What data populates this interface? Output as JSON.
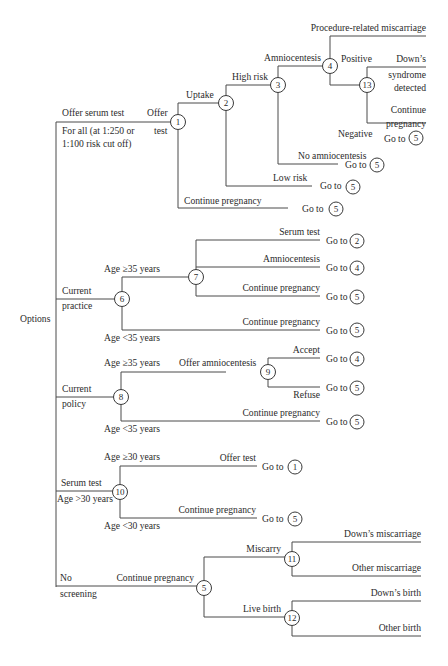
{
  "diagram": {
    "root_label": "Options",
    "options": {
      "offer_serum_test": {
        "label": "Offer serum test",
        "sublabel_1": "For all (at 1:250 or",
        "sublabel_2": "1:100 risk cut off)"
      },
      "current_practice": {
        "label_1": "Current",
        "label_2": "practice"
      },
      "current_policy": {
        "label_1": "Current",
        "label_2": "policy"
      },
      "serum_test": {
        "label": "Serum test",
        "sublabel": "Age >30 years"
      },
      "no_screening": {
        "label_1": "No",
        "label_2": "screening"
      }
    },
    "branches": {
      "offer": "Offer",
      "test": "test",
      "uptake": "Uptake",
      "high_risk": "High risk",
      "amniocentesis": "Amniocentesis",
      "procedure_miscarriage": "Procedure-related miscarriage",
      "positive": "Positive",
      "downs_1": "Down’s",
      "downs_2": "syndrome",
      "downs_3": "detected",
      "continue_1": "Continue",
      "continue_2": "pregnancy",
      "negative": "Negative",
      "no_amnio": "No amniocentesis",
      "low_risk": "Low risk",
      "continue_pregnancy": "Continue pregnancy",
      "age_ge35": "Age ≥35 years",
      "age_lt35": "Age <35 years",
      "serum_test": "Serum test",
      "offer_amnio": "Offer amniocentesis",
      "accept": "Accept",
      "refuse": "Refuse",
      "age_ge30": "Age ≥30 years",
      "age_lt30": "Age <30 years",
      "offer_test": "Offer test",
      "miscarry": "Miscarry",
      "live_birth": "Live birth",
      "downs_miscarriage": "Down’s miscarriage",
      "other_miscarriage": "Other miscarriage",
      "downs_birth": "Down’s birth",
      "other_birth": "Other birth"
    },
    "goto_label": "Go to",
    "nodes": [
      "1",
      "2",
      "3",
      "4",
      "5",
      "6",
      "7",
      "8",
      "9",
      "10",
      "11",
      "12",
      "13"
    ],
    "goto_targets": {
      "negative": "5",
      "no_amnio": "5",
      "low_risk": "5",
      "cont_1": "5",
      "serum_7": "2",
      "amnio_7": "4",
      "cont_7": "5",
      "cont_6": "5",
      "accept_9": "4",
      "refuse_9": "5",
      "cont_8": "5",
      "offer_10": "1",
      "cont_10": "5"
    }
  }
}
